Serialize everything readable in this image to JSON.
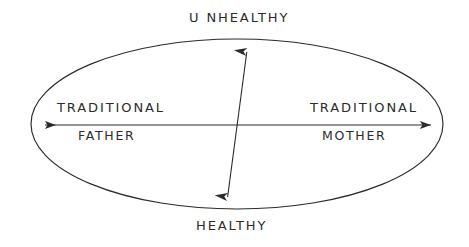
{
  "diagram": {
    "ink_color": "#2b2b2b",
    "background_color": "#ffffff",
    "axes": {
      "horizontal": {
        "name": "parent-role-axis",
        "left_label_primary": "TRADITIONAL",
        "left_label_secondary": "FATHER",
        "right_label_primary": "TRADITIONAL",
        "right_label_secondary": "MOTHER",
        "arrowheads": "both"
      },
      "vertical": {
        "name": "health-axis",
        "top_label": "UNHEALTHY",
        "bottom_label": "HEALTHY",
        "arrowheads": "both"
      }
    },
    "labels": {
      "unhealthy": "U NHEALTHY",
      "healthy": "HEALTHY",
      "traditional_left": "TRADITIONAL",
      "father": "FATHER",
      "traditional_right": "TRADITIONAL",
      "mother": "MOTHER"
    },
    "shapes": {
      "ellipse_name": "boundary-ellipse"
    }
  }
}
